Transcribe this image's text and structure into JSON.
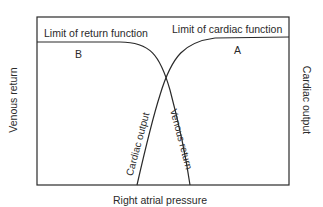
{
  "diagram": {
    "labels": {
      "x_axis": "Right atrial pressure",
      "left_axis": "Venous return",
      "right_axis": "Cardiac output",
      "limit_return": "Limit of return function",
      "limit_cardiac": "Limit of cardiac function",
      "point_b": "B",
      "point_a": "A",
      "curve_cardiac": "Cardiac output",
      "curve_venous": "Venous return"
    },
    "colors": {
      "line": "#2a2a2a",
      "background": "#ffffff"
    }
  }
}
